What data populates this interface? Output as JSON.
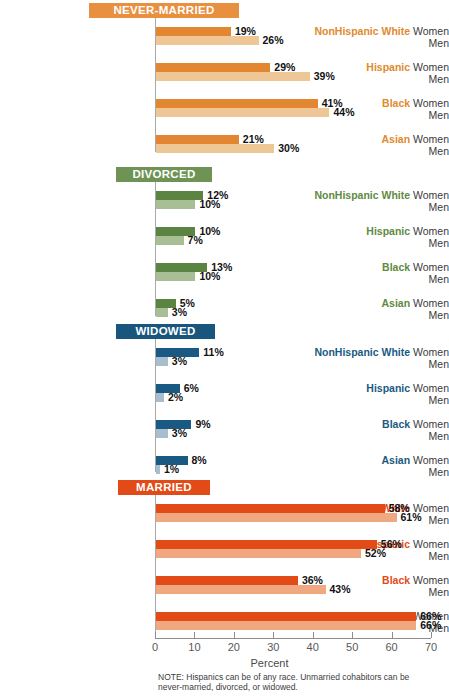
{
  "chart_data": {
    "type": "bar",
    "title": "",
    "xlabel": "Percent",
    "ylabel": "",
    "xlim": [
      0,
      70
    ],
    "xticks": [
      0,
      10,
      20,
      30,
      40,
      50,
      60,
      70
    ],
    "orientation": "horizontal",
    "grid": false,
    "legend": "none",
    "note": "NOTE: Hispanics can be of any race. Unmarried cohabitors can be never-married, divorced, or widowed.",
    "categories": [
      "NonHispanic White",
      "Hispanic",
      "Black",
      "Asian"
    ],
    "sexes": [
      "Women",
      "Men"
    ],
    "panels": [
      {
        "name": "NEVER-MARRIED",
        "badge_color": "#E89040",
        "label_color": "#E08A2E",
        "women_color": "#E28631",
        "men_color": "#EFC695",
        "series": [
          {
            "name": "Women",
            "values": [
              19,
              29,
              41,
              21
            ],
            "labels": [
              "19%",
              "29%",
              "41%",
              "21%"
            ]
          },
          {
            "name": "Men",
            "values": [
              26,
              39,
              44,
              30
            ],
            "labels": [
              "26%",
              "39%",
              "44%",
              "30%"
            ]
          }
        ]
      },
      {
        "name": "DIVORCED",
        "badge_color": "#6E9355",
        "label_color": "#5F8A42",
        "women_color": "#5B8341",
        "men_color": "#A8BE94",
        "series": [
          {
            "name": "Women",
            "values": [
              12,
              10,
              13,
              5
            ],
            "labels": [
              "12%",
              "10%",
              "13%",
              "5%"
            ]
          },
          {
            "name": "Men",
            "values": [
              10,
              7,
              10,
              3
            ],
            "labels": [
              "10%",
              "7%",
              "10%",
              "3%"
            ]
          }
        ]
      },
      {
        "name": "WIDOWED",
        "badge_color": "#19567E",
        "label_color": "#1A5A82",
        "women_color": "#1A5A82",
        "men_color": "#A8BECE",
        "series": [
          {
            "name": "Women",
            "values": [
              11,
              6,
              9,
              8
            ],
            "labels": [
              "11%",
              "6%",
              "9%",
              "8%"
            ]
          },
          {
            "name": "Men",
            "values": [
              3,
              2,
              3,
              1
            ],
            "labels": [
              "3%",
              "2%",
              "3%",
              "1%"
            ]
          }
        ]
      },
      {
        "name": "MARRIED",
        "badge_color": "#E24B18",
        "label_color": "#E24B18",
        "women_color": "#E24B18",
        "men_color": "#EFA87F",
        "series": [
          {
            "name": "Women",
            "values": [
              58,
              56,
              36,
              66
            ],
            "labels": [
              "58%",
              "56%",
              "36%",
              "66%"
            ]
          },
          {
            "name": "Men",
            "values": [
              61,
              52,
              43,
              66
            ],
            "labels": [
              "61%",
              "52%",
              "43%",
              "66%"
            ]
          }
        ]
      }
    ]
  },
  "axis": {
    "tick_labels": [
      "0",
      "10",
      "20",
      "30",
      "40",
      "50",
      "60",
      "70"
    ],
    "title": "Percent"
  },
  "note": {
    "text": "NOTE: Hispanics can be of any race. Unmarried cohabitors can be never-married, divorced, or widowed."
  }
}
